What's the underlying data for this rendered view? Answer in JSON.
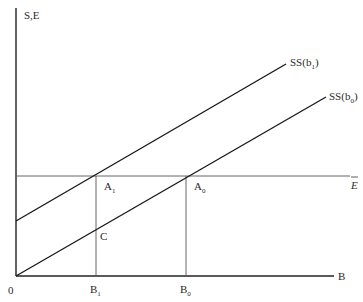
{
  "diagram": {
    "y_axis_label": "S,E",
    "x_axis_label": "B",
    "origin_label": "0",
    "curves": [
      {
        "name": "SS(b1)",
        "base": "SS(b",
        "sub": "1",
        "close": ")"
      },
      {
        "name": "SS(b0)",
        "base": "SS(b",
        "sub": "0",
        "close": ")"
      }
    ],
    "horizontal_line_label": "E",
    "points": [
      {
        "name": "A1",
        "base": "A",
        "sub": "1"
      },
      {
        "name": "A0",
        "base": "A",
        "sub": "0"
      },
      {
        "name": "C",
        "base": "C",
        "sub": ""
      }
    ],
    "x_ticks": [
      {
        "name": "B1",
        "base": "B",
        "sub": "1"
      },
      {
        "name": "B0",
        "base": "B",
        "sub": "0"
      }
    ]
  }
}
